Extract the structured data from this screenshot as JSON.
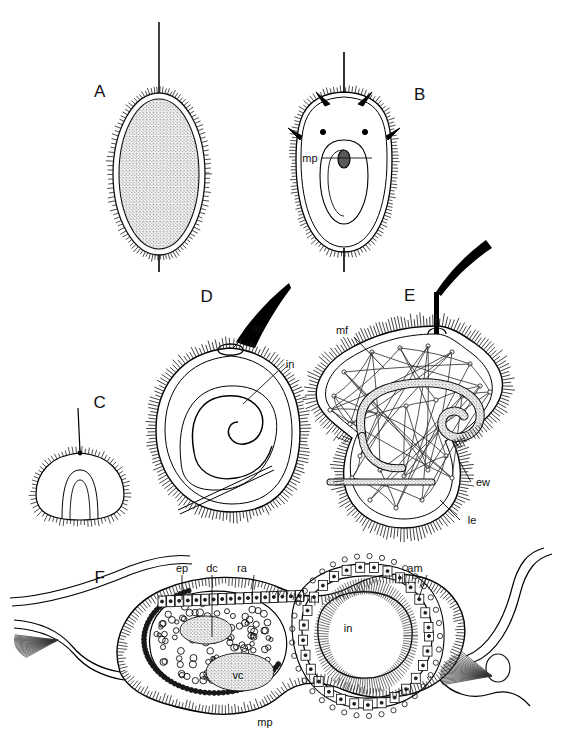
{
  "figure": {
    "kind": "scientific-line-drawing",
    "style": "black-and-white pen-and-ink stipple",
    "background_color": "#ffffff",
    "ink_color": "#000000",
    "width": 564,
    "height": 752,
    "panel_count": 6
  },
  "panels": [
    {
      "id": "A",
      "letter": "A",
      "letter_x": 100,
      "letter_y": 92,
      "description": "uniformly ciliated ovoid larva with long apical cilium and short posterior cilium",
      "annotations": []
    },
    {
      "id": "B",
      "letter": "B",
      "letter_x": 420,
      "letter_y": 95,
      "description": "ovoid larva bearing stiff spines and an internal elongate pouch",
      "annotations": [
        {
          "text": "mp",
          "x": 310,
          "y": 158,
          "leader_to_x": 372,
          "leader_to_y": 158
        }
      ]
    },
    {
      "id": "C",
      "letter": "C",
      "letter_x": 100,
      "letter_y": 403,
      "description": "small dome-shaped early stage with fine apical cilium",
      "annotations": []
    },
    {
      "id": "D",
      "letter": "D",
      "letter_x": 207,
      "letter_y": 297,
      "description": "rounded ciliated body with thick curved apical flagellum and coiled internal sac",
      "annotations": [
        {
          "text": "ap",
          "x": 258,
          "y": 328,
          "leader_to_x": 233,
          "leader_to_y": 348
        },
        {
          "text": "in",
          "x": 290,
          "y": 364,
          "leader_to_x": 243,
          "leader_to_y": 404
        }
      ]
    },
    {
      "id": "E",
      "letter": "E",
      "letter_x": 410,
      "letter_y": 296,
      "description": "trilobed ciliated body showing muscle fibre network and coiled stippled gut",
      "annotations": [
        {
          "text": "mf",
          "x": 342,
          "y": 330,
          "leader_to_x": 384,
          "leader_to_y": 368
        },
        {
          "text": "ew",
          "x": 483,
          "y": 482,
          "leader_to_x": 460,
          "leader_to_y": 462
        },
        {
          "text": "le",
          "x": 472,
          "y": 520,
          "leader_to_x": 440,
          "leader_to_y": 500
        }
      ]
    },
    {
      "id": "F",
      "letter": "F",
      "letter_x": 100,
      "letter_y": 578,
      "description": "large sagittal section through the larva showing epithelium, cell layers and gut lumen",
      "annotations": [
        {
          "text": "ep",
          "x": 182,
          "y": 568,
          "leader_to_x": 182,
          "leader_to_y": 600
        },
        {
          "text": "dc",
          "x": 212,
          "y": 568,
          "leader_to_x": 212,
          "leader_to_y": 637
        },
        {
          "text": "ra",
          "x": 242,
          "y": 568,
          "leader_to_x": 252,
          "leader_to_y": 595
        },
        {
          "text": "am",
          "x": 415,
          "y": 568,
          "leader_to_x": 418,
          "leader_to_y": 600
        },
        {
          "text": "in",
          "x": 348,
          "y": 628,
          "leader_to_x": null,
          "leader_to_y": null
        },
        {
          "text": "vc",
          "x": 238,
          "y": 675,
          "leader_to_x": null,
          "leader_to_y": null
        },
        {
          "text": "mp",
          "x": 265,
          "y": 722,
          "leader_to_x": null,
          "leader_to_y": null
        }
      ]
    }
  ],
  "abbreviations": [
    "mp",
    "ap",
    "in",
    "mf",
    "ew",
    "le",
    "ep",
    "dc",
    "ra",
    "am",
    "vc"
  ]
}
